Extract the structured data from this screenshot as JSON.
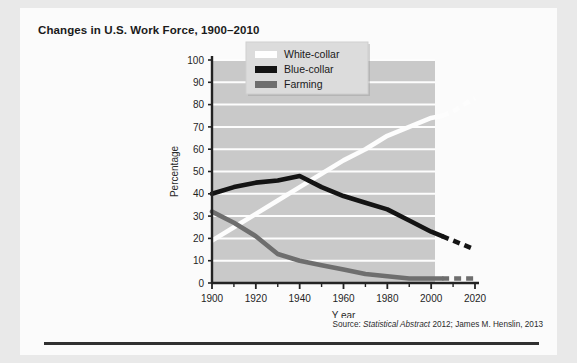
{
  "figure": {
    "title": "Changes in U.S. Work Force, 1900–2010",
    "source_prefix": "Source:",
    "source_italic": "Statistical Abstract",
    "source_rest": "2012; James M. Henslin, 2013"
  },
  "chart_data": {
    "type": "line",
    "title": "Changes in U.S. Work Force, 1900–2010",
    "xlabel": "Y ear",
    "ylabel": "Percentage",
    "xlim": [
      1900,
      2020
    ],
    "ylim": [
      0,
      100
    ],
    "xticks": [
      1900,
      1920,
      1940,
      1960,
      1980,
      2000,
      2020
    ],
    "xminorticks": [
      1910,
      1930,
      1950,
      1970,
      1990,
      2010
    ],
    "yticks": [
      0,
      10,
      20,
      30,
      40,
      50,
      60,
      70,
      80,
      90,
      100
    ],
    "grid": "horizontal",
    "legend_position": "top-left-inside",
    "projection_note": "Dashed segments after 2005 are projections",
    "series": [
      {
        "name": "White-collar",
        "color": "#fdfdfd",
        "x": [
          1900,
          1910,
          1920,
          1930,
          1940,
          1950,
          1960,
          1970,
          1980,
          1990,
          2000,
          2005
        ],
        "values": [
          19,
          25,
          31,
          37,
          43,
          49,
          55,
          60,
          66,
          70,
          74,
          75
        ],
        "projection_x": [
          2005,
          2010,
          2015,
          2020
        ],
        "projection_values": [
          75,
          77,
          80,
          83
        ]
      },
      {
        "name": "Blue-collar",
        "color": "#141414",
        "x": [
          1900,
          1910,
          1920,
          1930,
          1940,
          1950,
          1960,
          1970,
          1980,
          1990,
          2000,
          2005
        ],
        "values": [
          40,
          43,
          45,
          46,
          48,
          43,
          39,
          36,
          33,
          28,
          23,
          21
        ],
        "projection_x": [
          2005,
          2010,
          2015,
          2020
        ],
        "projection_values": [
          21,
          19,
          17,
          15
        ]
      },
      {
        "name": "Farming",
        "color": "#6e6e6e",
        "x": [
          1900,
          1910,
          1920,
          1930,
          1940,
          1950,
          1960,
          1970,
          1980,
          1990,
          2000,
          2005
        ],
        "values": [
          32,
          27,
          21,
          13,
          10,
          8,
          6,
          4,
          3,
          2,
          2,
          2
        ],
        "projection_x": [
          2005,
          2010,
          2015,
          2020
        ],
        "projection_values": [
          2,
          2,
          2,
          2
        ]
      }
    ]
  },
  "legend": {
    "items": [
      {
        "label": "White-collar",
        "color": "#ffffff"
      },
      {
        "label": "Blue-collar",
        "color": "#141414"
      },
      {
        "label": "Farming",
        "color": "#6e6e6e"
      }
    ]
  },
  "colors": {
    "plot_background": "#c9c9c9",
    "gridline": "#fdfdfd",
    "axis": "#232323",
    "page": "#fbfbfb",
    "rule": "#303030"
  }
}
